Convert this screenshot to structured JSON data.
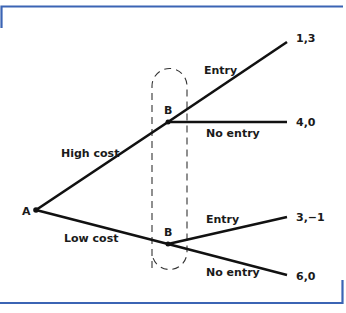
{
  "colors": {
    "frame": "#3b64b4",
    "line": "#111111",
    "dash": "#333333",
    "text": "#1a1a1a"
  },
  "nodes": {
    "root": {
      "label": "A",
      "x": 36,
      "y": 210
    },
    "upper": {
      "label": "B",
      "x": 168,
      "y": 122
    },
    "lower": {
      "label": "B",
      "x": 168,
      "y": 244
    }
  },
  "branches": {
    "high_cost": "High cost",
    "low_cost": "Low cost",
    "upper_entry": "Entry",
    "upper_no_entry": "No entry",
    "lower_entry": "Entry",
    "lower_no_entry": "No entry"
  },
  "payoffs": {
    "high_entry": "1,3",
    "high_no_entry": "4,0",
    "low_entry": "3,−1",
    "low_no_entry": "6,0"
  },
  "information_set": {
    "style": "dashed",
    "encloses": [
      "upper B",
      "lower B"
    ]
  }
}
